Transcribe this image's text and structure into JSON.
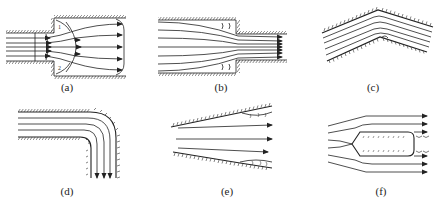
{
  "figure": {
    "panels": [
      {
        "id": "a",
        "label": "(a)",
        "geometry": "sudden-expansion",
        "note": "flow from narrow pipe into wider pipe with recirculation corners marked 1 and 2",
        "corner_marks": [
          "1",
          "2"
        ]
      },
      {
        "id": "b",
        "label": "(b)",
        "geometry": "sudden-contraction",
        "note": "flow from wide pipe into narrow pipe with eddies before the step"
      },
      {
        "id": "c",
        "label": "(c)",
        "geometry": "angled-bend",
        "note": "streamlines through an inverted-V channel with eddy at inner corner"
      },
      {
        "id": "d",
        "label": "(d)",
        "geometry": "90-degree-elbow",
        "note": "horizontal flow turning downward with eddy at inner corner"
      },
      {
        "id": "e",
        "label": "(e)",
        "geometry": "diverging-duct",
        "note": "flow in expanding channel with separation near downstream walls"
      },
      {
        "id": "f",
        "label": "(f)",
        "geometry": "bluff-body",
        "note": "flow around a pointed-nose body with wake eddies behind blunt end"
      }
    ]
  },
  "colors": {
    "line": "#222222",
    "hatch": "#333333",
    "background": "#ffffff"
  }
}
